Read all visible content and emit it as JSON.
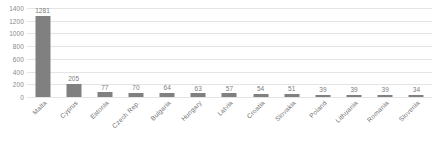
{
  "chart_data": {
    "type": "bar",
    "title": "",
    "subtitle": "",
    "xlabel": "",
    "ylabel": "",
    "categories": [
      "Malta",
      "Cyprus",
      "Estonia",
      "Czech Rep.",
      "Bulgaria",
      "Hungary",
      "Latvia",
      "Croatia",
      "Slovakia",
      "Poland",
      "Lithuania",
      "Romania",
      "Slovenia"
    ],
    "values": [
      1281,
      205,
      77,
      70,
      64,
      63,
      57,
      54,
      51,
      39,
      39,
      39,
      34
    ],
    "data_labels": [
      "1281",
      "205",
      "77",
      "70",
      "64",
      "63",
      "57",
      "54",
      "51",
      "39",
      "39",
      "39",
      "34"
    ],
    "ylim": [
      0,
      1400
    ],
    "yticks": [
      0,
      200,
      400,
      600,
      800,
      1000,
      1200,
      1400
    ],
    "ytick_labels": [
      "0",
      "200",
      "400",
      "600",
      "800",
      "1000",
      "1200",
      "1400"
    ],
    "grid": true,
    "legend": false,
    "legend_position": "none",
    "series": [
      {
        "name": "",
        "values": [
          1281,
          205,
          77,
          70,
          64,
          63,
          57,
          54,
          51,
          39,
          39,
          39,
          34
        ],
        "color": "#808080"
      }
    ]
  },
  "style": {
    "bar_color": "#808080",
    "gridline_color": "#e4e4e4",
    "tick_label_color": "#8a8a8a",
    "value_label_color": "#7d7d7d",
    "category_label_color": "#6f6f6f",
    "background": "#ffffff"
  }
}
